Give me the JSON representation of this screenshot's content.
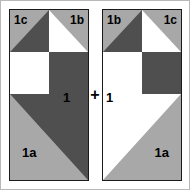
{
  "diagram": {
    "operator": "+",
    "colors": {
      "dark": "#4f4f4f",
      "light": "#a8a8a8",
      "white": "#ffffff",
      "outline": "#1a1a1a",
      "frame": "#b8b8b8",
      "label": "#000000"
    }
  },
  "blocks": [
    {
      "id": "left",
      "labels": {
        "top_left": "1c",
        "top_right": "1b",
        "bottom_left": "1a",
        "center": "1"
      },
      "cells": [
        {
          "row": 0,
          "col": 0,
          "pattern": "half-square-triangle",
          "base": "light",
          "triangle": "lower-right",
          "triangle_fill": "dark"
        },
        {
          "row": 0,
          "col": 1,
          "pattern": "half-square-triangle",
          "base": "light",
          "triangle": "lower-left",
          "triangle_fill": "white"
        },
        {
          "row": 1,
          "col": 0,
          "pattern": "solid",
          "base": "white"
        },
        {
          "row": 1,
          "col": 1,
          "pattern": "solid",
          "base": "dark"
        },
        {
          "row": 2,
          "col": 0,
          "pattern": "solid",
          "base": "dark"
        },
        {
          "row": 2,
          "col": 1,
          "pattern": "solid",
          "base": "white"
        },
        {
          "row": 3,
          "col": 0,
          "pattern": "corner-triangle",
          "base": "light",
          "triangle": "lower-left",
          "triangle_fill": "light"
        },
        {
          "row": 3,
          "col": 1,
          "pattern": "corner-triangle",
          "base": "dark",
          "triangle": "lower-left",
          "triangle_fill": "light"
        }
      ]
    },
    {
      "id": "right",
      "labels": {
        "top_left": "1b",
        "top_right": "1c",
        "bottom_right": "1a",
        "center": "1"
      },
      "cells": [
        {
          "row": 0,
          "col": 0,
          "pattern": "half-square-triangle",
          "base": "light",
          "triangle": "lower-right",
          "triangle_fill": "dark"
        },
        {
          "row": 0,
          "col": 1,
          "pattern": "half-square-triangle",
          "base": "light",
          "triangle": "lower-left",
          "triangle_fill": "white"
        },
        {
          "row": 1,
          "col": 0,
          "pattern": "solid",
          "base": "white"
        },
        {
          "row": 1,
          "col": 1,
          "pattern": "solid",
          "base": "dark"
        },
        {
          "row": 2,
          "col": 0,
          "pattern": "solid",
          "base": "dark"
        },
        {
          "row": 2,
          "col": 1,
          "pattern": "solid",
          "base": "white"
        },
        {
          "row": 3,
          "col": 0,
          "pattern": "corner-triangle",
          "base": "white",
          "triangle": "lower-right",
          "triangle_fill": "light"
        },
        {
          "row": 3,
          "col": 1,
          "pattern": "corner-triangle",
          "base": "light",
          "triangle": "lower-right",
          "triangle_fill": "light"
        }
      ]
    }
  ]
}
